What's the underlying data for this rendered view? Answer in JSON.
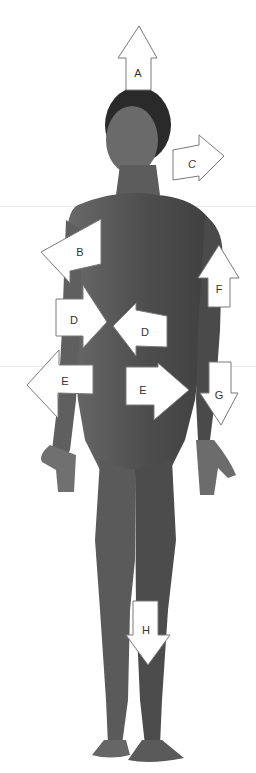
{
  "figure": {
    "arrows": [
      {
        "label": "A",
        "direction": "up"
      },
      {
        "label": "B",
        "direction": "left"
      },
      {
        "label": "C",
        "direction": "right"
      },
      {
        "label": "D",
        "direction": "right"
      },
      {
        "label": "D",
        "direction": "left"
      },
      {
        "label": "E",
        "direction": "left"
      },
      {
        "label": "E",
        "direction": "right"
      },
      {
        "label": "F",
        "direction": "up"
      },
      {
        "label": "G",
        "direction": "down"
      },
      {
        "label": "H",
        "direction": "down"
      }
    ]
  },
  "colors": {
    "background": "#ffffff",
    "skin": "#5a5a5a",
    "arrow_fill": "#ffffff",
    "arrow_stroke": "#7a7a7a"
  }
}
